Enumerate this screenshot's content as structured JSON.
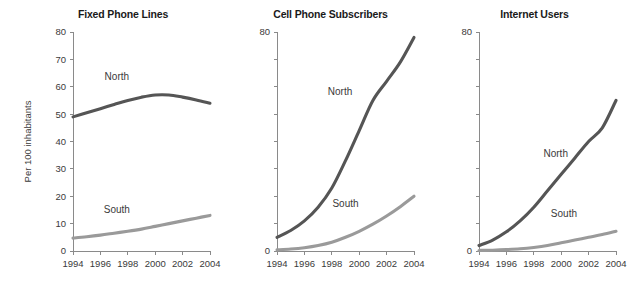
{
  "figure": {
    "background": "#ffffff",
    "series_colors": {
      "North": "#555555",
      "South": "#9a9a9a"
    },
    "y_axis_title": "Per 100 inhabitants",
    "series_label_north": "North",
    "series_label_south": "South"
  },
  "chart_data": [
    {
      "type": "line",
      "title": "Fixed Phone Lines",
      "xlabel": "",
      "ylabel": "Per 100 inhabitants",
      "x": [
        1994,
        1995,
        1996,
        1997,
        1998,
        1999,
        2000,
        2001,
        2002,
        2003,
        2004
      ],
      "xlim": [
        1994,
        2004
      ],
      "ylim": [
        0,
        80
      ],
      "xticks": [
        1994,
        1996,
        1998,
        2000,
        2002,
        2004
      ],
      "xticklabels": [
        "1994",
        "1996",
        "1998",
        "2000",
        "2002",
        "2004"
      ],
      "yticks": [
        0,
        10,
        20,
        30,
        40,
        50,
        60,
        70,
        80
      ],
      "yticklabels": [
        "0",
        "10",
        "20",
        "30",
        "40",
        "50",
        "60",
        "70",
        "80"
      ],
      "grid": false,
      "legend": "inline-annotations",
      "series": [
        {
          "name": "North",
          "color": "#555555",
          "values": [
            49.0,
            50.5,
            52.0,
            53.5,
            55.0,
            56.2,
            57.0,
            57.0,
            56.2,
            55.2,
            54.0
          ]
        },
        {
          "name": "South",
          "color": "#9a9a9a",
          "values": [
            4.7,
            5.2,
            5.8,
            6.5,
            7.2,
            8.0,
            9.0,
            10.0,
            11.0,
            12.0,
            13.0
          ]
        }
      ],
      "annotations": [
        {
          "text": "North",
          "x": 1997.2,
          "y": 62.5
        },
        {
          "text": "South",
          "x": 1997.2,
          "y": 13.8
        }
      ]
    },
    {
      "type": "line",
      "title": "Cell Phone Subscribers",
      "xlabel": "",
      "ylabel": "",
      "x": [
        1994,
        1995,
        1996,
        1997,
        1998,
        1999,
        2000,
        2001,
        2002,
        2003,
        2004
      ],
      "xlim": [
        1994,
        2004
      ],
      "ylim": [
        0,
        80
      ],
      "xticks": [
        1994,
        1996,
        1998,
        2000,
        2002,
        2004
      ],
      "xticklabels": [
        "1994",
        "1996",
        "1998",
        "2000",
        "2002",
        "2004"
      ],
      "yticks": [
        0,
        10,
        20,
        30,
        40,
        50,
        60,
        70,
        80
      ],
      "yticklabels": [
        "0",
        "",
        "",
        "",
        "",
        "",
        "",
        "",
        "80"
      ],
      "grid": false,
      "legend": "inline-annotations",
      "series": [
        {
          "name": "North",
          "color": "#555555",
          "values": [
            5.0,
            7.5,
            11.0,
            16.0,
            23.0,
            33.0,
            44.0,
            55.0,
            62.0,
            69.0,
            78.0
          ]
        },
        {
          "name": "South",
          "color": "#9a9a9a",
          "values": [
            0.4,
            0.7,
            1.2,
            2.0,
            3.2,
            5.0,
            7.2,
            9.8,
            12.8,
            16.2,
            20.0
          ]
        }
      ],
      "annotations": [
        {
          "text": "North",
          "x": 1998.6,
          "y": 57.0
        },
        {
          "text": "South",
          "x": 1999.0,
          "y": 16.0
        }
      ]
    },
    {
      "type": "line",
      "title": "Internet Users",
      "xlabel": "",
      "ylabel": "",
      "x": [
        1994,
        1995,
        1996,
        1997,
        1998,
        1999,
        2000,
        2001,
        2002,
        2003,
        2004
      ],
      "xlim": [
        1994,
        2004
      ],
      "ylim": [
        0,
        80
      ],
      "xticks": [
        1994,
        1996,
        1998,
        2000,
        2002,
        2004
      ],
      "xticklabels": [
        "1994",
        "1996",
        "1998",
        "2000",
        "2002",
        "2004"
      ],
      "yticks": [
        0,
        10,
        20,
        30,
        40,
        50,
        60,
        70,
        80
      ],
      "yticklabels": [
        "0",
        "",
        "",
        "",
        "",
        "",
        "",
        "",
        "80"
      ],
      "grid": false,
      "legend": "inline-annotations",
      "series": [
        {
          "name": "North",
          "color": "#555555",
          "values": [
            2.0,
            4.0,
            7.0,
            11.0,
            16.0,
            22.0,
            28.0,
            34.0,
            40.0,
            45.0,
            55.0
          ]
        },
        {
          "name": "South",
          "color": "#9a9a9a",
          "values": [
            0.2,
            0.3,
            0.5,
            0.8,
            1.3,
            2.0,
            3.0,
            4.0,
            5.0,
            6.0,
            7.2
          ]
        }
      ],
      "annotations": [
        {
          "text": "North",
          "x": 1999.6,
          "y": 34.5
        },
        {
          "text": "South",
          "x": 2000.2,
          "y": 12.5
        }
      ]
    }
  ]
}
